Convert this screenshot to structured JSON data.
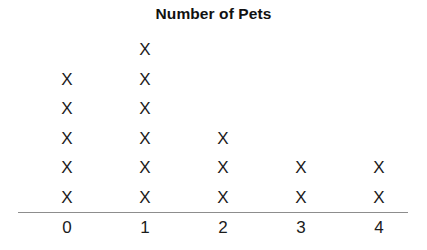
{
  "chart_data": {
    "type": "dotplot",
    "title": "Number of Pets",
    "xlabel": "",
    "ylabel": "",
    "mark": "X",
    "categories": [
      "0",
      "1",
      "2",
      "3",
      "4"
    ],
    "values": [
      5,
      6,
      3,
      2,
      2
    ],
    "ylim": [
      0,
      6
    ],
    "grid": false,
    "legend": null,
    "axis_color": "#8d8d8d",
    "mark_color": "#1b1b1b",
    "title_color": "#111111",
    "background": "#ffffff",
    "column_x": [
      67,
      145,
      223,
      301,
      379
    ],
    "axis_line": {
      "x_start": 18,
      "x_end": 408,
      "y": 212
    }
  }
}
